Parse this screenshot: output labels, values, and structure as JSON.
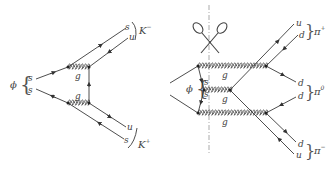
{
  "diagrams": [
    {
      "id": "kaon-decay",
      "initial": {
        "label": "ϕ",
        "quarks": [
          "s",
          "s"
        ]
      },
      "gluons": [
        "g",
        "g"
      ],
      "final": [
        {
          "meson": "K",
          "charge": "−",
          "quarks": [
            "s",
            "u"
          ]
        },
        {
          "meson": "K",
          "charge": "+",
          "quarks": [
            "u",
            "s"
          ]
        }
      ]
    },
    {
      "id": "pion-decay-cut",
      "initial": {
        "label": "ϕ",
        "quarks": [
          "s",
          "s"
        ]
      },
      "gluons": [
        "g",
        "g",
        "g"
      ],
      "cut_icon": "scissors-icon",
      "final": [
        {
          "meson": "π",
          "charge": "+",
          "quarks": [
            "u",
            "d"
          ]
        },
        {
          "meson": "π",
          "charge": "0",
          "quarks": [
            "d",
            "d"
          ]
        },
        {
          "meson": "π",
          "charge": "−",
          "quarks": [
            "d",
            "u"
          ]
        }
      ]
    }
  ]
}
